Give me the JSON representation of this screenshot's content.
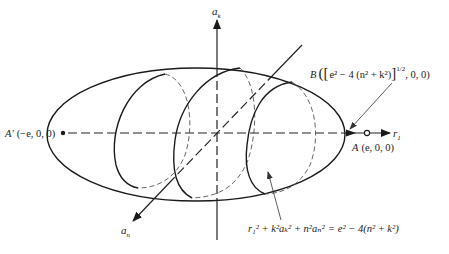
{
  "figure": {
    "axes": {
      "vertical": {
        "label": "a",
        "subscript": "k"
      },
      "diagonal": {
        "label": "a",
        "subscript": "n"
      },
      "horizontal": {
        "label": "r",
        "subscript": "1"
      }
    },
    "points": {
      "a_prime": {
        "name": "A′",
        "coords": "(−e, 0, 0)"
      },
      "a": {
        "name": "A",
        "coords": "(e, 0, 0)"
      },
      "b": {
        "name": "B",
        "open": "([",
        "expr": "e² − 4 (n² + k²)",
        "close_bracket": "]",
        "exponent": "1/2",
        "tail": ", 0, 0)"
      }
    },
    "equation": {
      "lhs": "r₁² + k²aₖ² + n²aₙ²",
      "equals": "=",
      "rhs": "e² − 4(n² + k²)"
    }
  }
}
